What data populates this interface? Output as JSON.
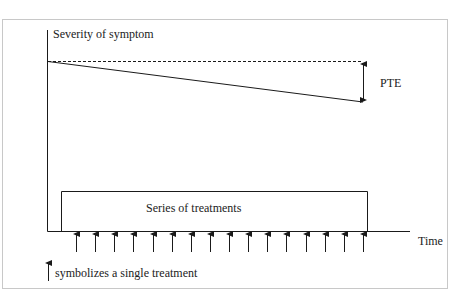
{
  "diagram": {
    "y_axis_label": "Severity of symptom",
    "x_axis_label": "Time",
    "effect_label": "PTE",
    "box_label": "Series of treatments",
    "legend_text": "symbolizes a single treatment",
    "treatment_count": 16,
    "line_color": "#1a1a1a",
    "frame_color": "#c8c8c8"
  }
}
